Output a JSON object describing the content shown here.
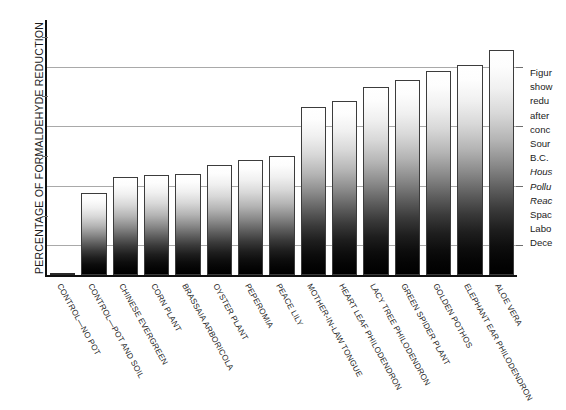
{
  "chart_data": {
    "type": "bar",
    "title": "",
    "xlabel": "",
    "ylabel": "PERCENTAGE OF FORMALDEHYDE REDUCTION",
    "ylim": [
      0,
      85
    ],
    "yticks": [
      0,
      20,
      40,
      60,
      80
    ],
    "ytick_labels": [
      "0",
      "20",
      "40",
      "60",
      "80"
    ],
    "gridlines": [
      10,
      30,
      50,
      70
    ],
    "grid": true,
    "legend": "none",
    "orientation": "vertical",
    "bar_fill": "white-to-black vertical gradient",
    "categories": [
      "CONTROL—NO POT",
      "CONTROL—POT AND SOIL",
      "CHINESE EVERGREEN",
      "CORN PLANT",
      "BRASSAIA ARBORICOLA",
      "OYSTER PLANT",
      "PEPEROMIA",
      "PEACE LILY",
      "MOTHER-IN-LAW TONGUE",
      "HEART LEAF PHILODENDRON",
      "LACY TREE PHILODENDRON",
      "GREEN SPIDER PLANT",
      "GOLDEN POTHOS",
      "ELEPHANT EAR PHILODENDRON",
      "ALOE VERA"
    ],
    "values": [
      0.3,
      27.5,
      33,
      33.5,
      34,
      37,
      38.5,
      40,
      56.5,
      58.5,
      63,
      65.5,
      68.5,
      70.5,
      75.5
    ],
    "value_unit": "percent"
  },
  "caption": {
    "lines": [
      {
        "text": "Figur",
        "italic": false
      },
      {
        "text": "show",
        "italic": false
      },
      {
        "text": "redu",
        "italic": false
      },
      {
        "text": "after",
        "italic": false
      },
      {
        "text": "conc",
        "italic": false
      },
      {
        "text": "Sour",
        "italic": false
      },
      {
        "text": "B.C.",
        "italic": false
      },
      {
        "text": "Hous",
        "italic": true
      },
      {
        "text": "Pollu",
        "italic": true
      },
      {
        "text": "Reac",
        "italic": true
      },
      {
        "text": "Spac",
        "italic": false
      },
      {
        "text": "Labo",
        "italic": false
      },
      {
        "text": "Dece",
        "italic": false
      }
    ]
  }
}
